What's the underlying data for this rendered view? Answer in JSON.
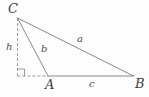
{
  "figure": {
    "type": "geometry-diagram",
    "canvas": {
      "width": 149,
      "height": 97,
      "background": "#fdfdfd"
    },
    "colors": {
      "stroke": "#8a8a8a",
      "stroke_dashed": "#9a9a9a",
      "label": "#3d3d3d",
      "side_label": "#4f4f4f"
    },
    "stroke_width": 1,
    "dash_pattern": "3 2",
    "vertices": [
      {
        "id": "C",
        "label": "C",
        "x": 17.5,
        "y": 18,
        "label_x": 8,
        "label_y": 2
      },
      {
        "id": "A",
        "label": "A",
        "x": 48,
        "y": 76,
        "label_x": 45,
        "label_y": 78
      },
      {
        "id": "B",
        "label": "B",
        "x": 133.5,
        "y": 76,
        "label_x": 135,
        "label_y": 77
      },
      {
        "id": "F",
        "label": "",
        "x": 17.5,
        "y": 76,
        "label_x": 0,
        "label_y": 0
      }
    ],
    "edges": [
      {
        "id": "a",
        "label": "a",
        "from": "C",
        "to": "B",
        "style": "solid",
        "label_x": 77,
        "label_y": 34
      },
      {
        "id": "b",
        "label": "b",
        "from": "C",
        "to": "A",
        "style": "solid",
        "label_x": 41,
        "label_y": 44
      },
      {
        "id": "c",
        "label": "c",
        "from": "A",
        "to": "B",
        "style": "solid",
        "label_x": 89,
        "label_y": 79
      },
      {
        "id": "h",
        "label": "h",
        "from": "C",
        "to": "F",
        "style": "dashed",
        "label_x": 6,
        "label_y": 42
      },
      {
        "id": "ext",
        "label": "",
        "from": "F",
        "to": "A",
        "style": "dashed",
        "label_x": 0,
        "label_y": 0
      }
    ],
    "right_angle": {
      "name": "right-angle-marker",
      "at": "F",
      "size": 7,
      "x": 17.5,
      "y": 76,
      "direction": "up-right"
    }
  }
}
